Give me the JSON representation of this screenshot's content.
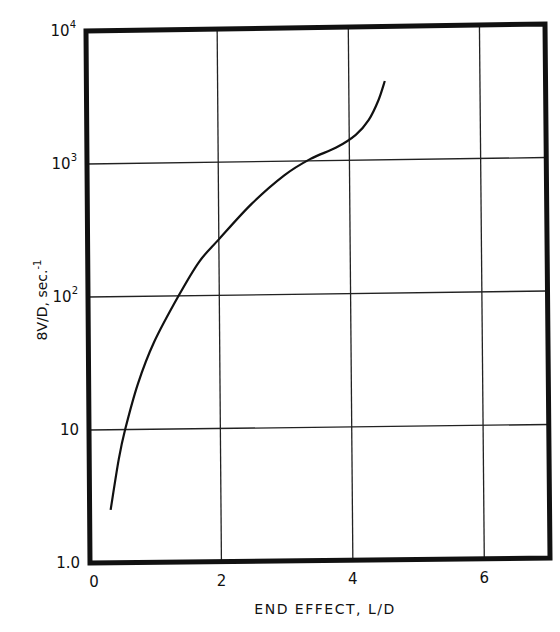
{
  "chart_data": {
    "type": "line",
    "title": "",
    "xlabel": "END EFFECT, L/D",
    "ylabel": "8V/D, sec.⁻¹",
    "xscale": "linear",
    "yscale": "log",
    "xlim": [
      0,
      7
    ],
    "ylim": [
      1.0,
      10000
    ],
    "x_ticks": [
      "0",
      "2",
      "4",
      "6"
    ],
    "y_ticks": [
      "1.0",
      "10",
      "10²",
      "10³",
      "10⁴"
    ],
    "grid": true,
    "legend": null,
    "series": [
      {
        "name": "curve",
        "x": [
          0.32,
          0.45,
          0.55,
          0.75,
          1.0,
          1.38,
          1.7,
          2.0,
          2.5,
          3.0,
          3.4,
          3.8,
          4.1,
          4.3,
          4.45,
          4.55
        ],
        "y": [
          2.5,
          6,
          10,
          22,
          45,
          100,
          180,
          263,
          480,
          780,
          1030,
          1250,
          1550,
          2000,
          2800,
          3900
        ]
      }
    ]
  },
  "labels": {
    "x_axis": "END EFFECT, L/D",
    "y_axis_main": "8V/D, sec.",
    "y_axis_sup": "-1",
    "x_ticks": [
      "0",
      "2",
      "4",
      "6"
    ],
    "y_ticks": [
      {
        "base": "1.0",
        "exp": ""
      },
      {
        "base": "10",
        "exp": ""
      },
      {
        "base": "10",
        "exp": "2"
      },
      {
        "base": "10",
        "exp": "3"
      },
      {
        "base": "10",
        "exp": "4"
      }
    ]
  }
}
